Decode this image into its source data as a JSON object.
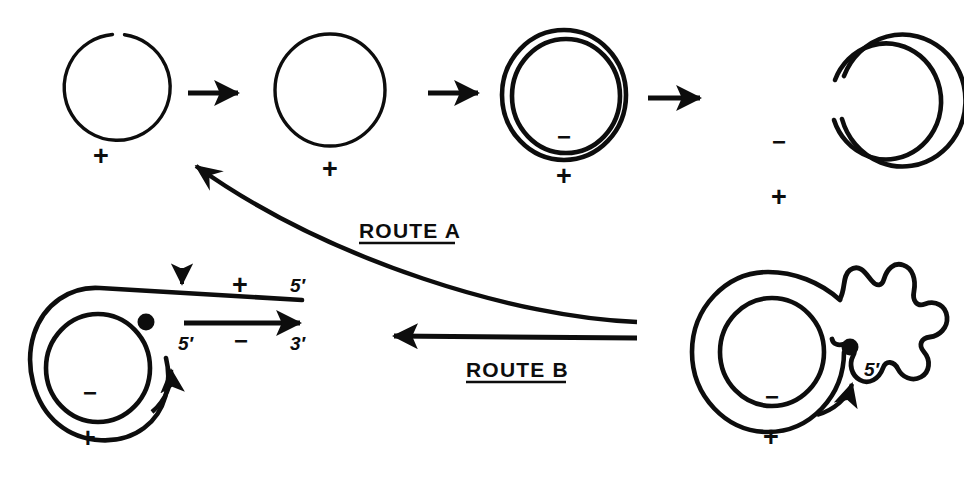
{
  "figure": {
    "ink_color": "#0d0d0d",
    "background_color": "#ffffff",
    "width": 964,
    "height": 477
  },
  "top_row": {
    "steps": [
      {
        "id": "step-1",
        "description": "open single-stranded circle with gap at top",
        "strand_labels": {
          "outer": "+"
        },
        "plus": "+"
      },
      {
        "id": "step-2",
        "description": "closed single-stranded circle",
        "strand_labels": {
          "outer": "+"
        },
        "plus": "+"
      },
      {
        "id": "step-3",
        "description": "closed double-stranded circle",
        "strand_labels": {
          "inner": "−",
          "outer": "+"
        },
        "minus": "−",
        "plus": "+"
      },
      {
        "id": "step-4",
        "description": "double-stranded circle nicked on the right side",
        "strand_labels": {
          "inner": "−",
          "outer": "+"
        },
        "minus": "−",
        "plus": "+"
      }
    ],
    "arrows": [
      {
        "id": "arrow-1-2",
        "direction": "right"
      },
      {
        "id": "arrow-2-3",
        "direction": "right"
      },
      {
        "id": "arrow-3-4",
        "direction": "right"
      }
    ]
  },
  "routes": {
    "route_a": {
      "label": "ROUTE A",
      "underlined": true,
      "direction": "right-to-left, curved upward"
    },
    "route_b": {
      "label": "ROUTE B",
      "underlined": true,
      "direction": "right-to-left, straight"
    }
  },
  "bottom_left": {
    "id": "rolling-circle-with-duplex-tail",
    "description": "rolling circle with displaced linear duplex tail",
    "circle_labels": {
      "inner": "−",
      "below": "+"
    },
    "minus": "−",
    "plus": "+",
    "top_strand": {
      "polarity": "+",
      "end_label": "5′",
      "nick_arrow": "down",
      "polarity_label": "+"
    },
    "bottom_strand": {
      "polarity": "−",
      "left_label": "5′",
      "right_label": "3′",
      "polarity_label": "−",
      "synthesis_arrow": "right"
    },
    "origin_dot": true,
    "rotation_arrow": "counterclockwise"
  },
  "bottom_right": {
    "id": "rolling-circle-with-ss-tail",
    "description": "rolling circle with displaced single-stranded coiled tail",
    "circle_labels": {
      "inner": "−",
      "below": "+"
    },
    "minus": "−",
    "plus": "+",
    "tail_end_label": "5′",
    "origin_dot": true,
    "rotation_arrow": "counterclockwise"
  }
}
